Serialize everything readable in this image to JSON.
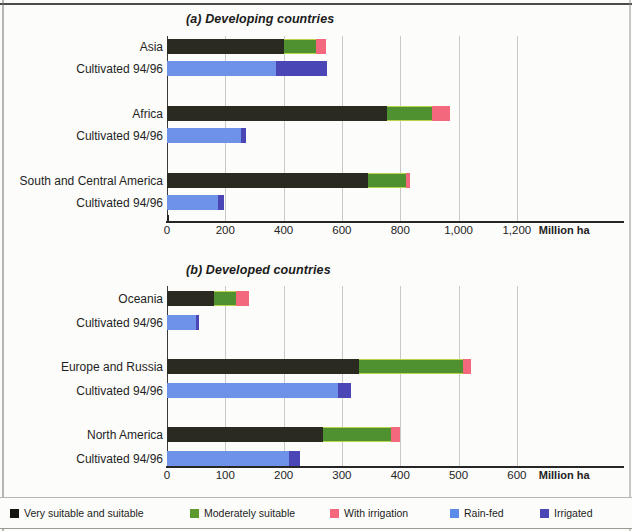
{
  "figure": {
    "axis_unit_label": "Million ha",
    "cultivated_row_label": "Cultivated 94/96"
  },
  "legend": {
    "items": [
      {
        "label": "Very suitable and suitable",
        "color": "#151510",
        "key": "very_suitable"
      },
      {
        "label": "Moderately suitable",
        "color": "#5c9a2e",
        "key": "moderately_suitable"
      },
      {
        "label": "With irrigation",
        "color": "#f4687e",
        "key": "with_irrigation"
      },
      {
        "label": "Rain-fed",
        "color": "#5b8ae8",
        "key": "rain_fed"
      },
      {
        "label": "Irrigated",
        "color": "#4b46b5",
        "key": "irrigated"
      }
    ]
  },
  "chart_data": [
    {
      "type": "bar",
      "orientation": "horizontal",
      "stacked": true,
      "title": "(a) Developing countries",
      "xlabel": "Million ha",
      "ylabel": "",
      "xlim": [
        0,
        1300
      ],
      "xticks": [
        0,
        200,
        400,
        600,
        800,
        1000,
        1200
      ],
      "xtick_labels": [
        "0",
        "200",
        "400",
        "600",
        "800",
        "1,000",
        "1,200"
      ],
      "grid": true,
      "legend_position": "bottom",
      "categories": [
        "Asia",
        "Africa",
        "South and Central America"
      ],
      "groups": [
        {
          "region": "Asia",
          "potential": {
            "label": "Asia",
            "segments": [
              {
                "name": "Very suitable and suitable",
                "value": 400
              },
              {
                "name": "Moderately suitable",
                "value": 110
              },
              {
                "name": "With irrigation",
                "value": 35
              }
            ],
            "total": 545
          },
          "cultivated": {
            "label": "Cultivated 94/96",
            "segments": [
              {
                "name": "Rain-fed",
                "value": 375
              },
              {
                "name": "Irrigated",
                "value": 175
              }
            ],
            "total": 550
          }
        },
        {
          "region": "Africa",
          "potential": {
            "label": "Africa",
            "segments": [
              {
                "name": "Very suitable and suitable",
                "value": 755
              },
              {
                "name": "Moderately suitable",
                "value": 155
              },
              {
                "name": "With irrigation",
                "value": 60
              }
            ],
            "total": 970
          },
          "cultivated": {
            "label": "Cultivated 94/96",
            "segments": [
              {
                "name": "Rain-fed",
                "value": 255
              },
              {
                "name": "Irrigated",
                "value": 15
              }
            ],
            "total": 270
          }
        },
        {
          "region": "South and Central America",
          "potential": {
            "label": "South and Central America",
            "segments": [
              {
                "name": "Very suitable and suitable",
                "value": 690
              },
              {
                "name": "Moderately suitable",
                "value": 130
              },
              {
                "name": "With irrigation",
                "value": 15
              }
            ],
            "total": 835
          },
          "cultivated": {
            "label": "Cultivated 94/96",
            "segments": [
              {
                "name": "Rain-fed",
                "value": 175
              },
              {
                "name": "Irrigated",
                "value": 20
              }
            ],
            "total": 195
          }
        }
      ]
    },
    {
      "type": "bar",
      "orientation": "horizontal",
      "stacked": true,
      "title": "(b) Developed countries",
      "xlabel": "Million ha",
      "ylabel": "",
      "xlim": [
        0,
        650
      ],
      "xticks": [
        0,
        100,
        200,
        300,
        400,
        500,
        600
      ],
      "xtick_labels": [
        "0",
        "100",
        "200",
        "300",
        "400",
        "500",
        "600"
      ],
      "grid": true,
      "legend_position": "bottom",
      "categories": [
        "Oceania",
        "Europe and Russia",
        "North America"
      ],
      "groups": [
        {
          "region": "Oceania",
          "potential": {
            "label": "Oceania",
            "segments": [
              {
                "name": "Very suitable and suitable",
                "value": 80
              },
              {
                "name": "Moderately suitable",
                "value": 38
              },
              {
                "name": "With irrigation",
                "value": 23
              }
            ],
            "total": 141
          },
          "cultivated": {
            "label": "Cultivated 94/96",
            "segments": [
              {
                "name": "Rain-fed",
                "value": 50
              },
              {
                "name": "Irrigated",
                "value": 5
              }
            ],
            "total": 55
          }
        },
        {
          "region": "Europe and Russia",
          "potential": {
            "label": "Europe and Russia",
            "segments": [
              {
                "name": "Very suitable and suitable",
                "value": 330
              },
              {
                "name": "Moderately suitable",
                "value": 177
              },
              {
                "name": "With irrigation",
                "value": 15
              }
            ],
            "total": 522
          },
          "cultivated": {
            "label": "Cultivated 94/96",
            "segments": [
              {
                "name": "Rain-fed",
                "value": 293
              },
              {
                "name": "Irrigated",
                "value": 22
              }
            ],
            "total": 315
          }
        },
        {
          "region": "North America",
          "potential": {
            "label": "North America",
            "segments": [
              {
                "name": "Very suitable and suitable",
                "value": 268
              },
              {
                "name": "Moderately suitable",
                "value": 117
              },
              {
                "name": "With irrigation",
                "value": 15
              }
            ],
            "total": 400
          },
          "cultivated": {
            "label": "Cultivated 94/96",
            "segments": [
              {
                "name": "Rain-fed",
                "value": 210
              },
              {
                "name": "Irrigated",
                "value": 18
              }
            ],
            "total": 228
          }
        }
      ]
    }
  ]
}
